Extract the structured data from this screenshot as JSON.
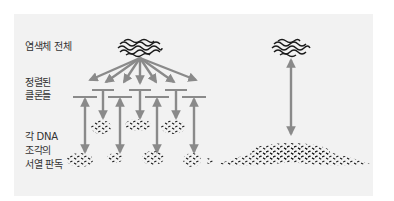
{
  "labels": {
    "whole_chromosome": "염색체 전체",
    "ordered_clones_line1": "정렬된",
    "ordered_clones_line2": "클론들",
    "sequence_line1": "각 DNA",
    "sequence_line2": "조각의",
    "sequence_line3": "서열 판독"
  },
  "colors": {
    "panel": "#f2f2f2",
    "arrow": "#8a8a8a",
    "dna": "#1a1a1a",
    "text": "#333333"
  },
  "diagram": {
    "left_method": "hierarchical clone-by-clone sequencing",
    "right_method": "whole-genome shotgun sequencing",
    "fan_arrow_count": 7,
    "upper_clone_bars": 3,
    "lower_clone_bars": 4
  }
}
